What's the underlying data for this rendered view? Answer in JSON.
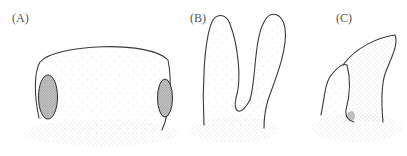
{
  "figure": {
    "panels": [
      {
        "id": "A",
        "label": "(A)"
      },
      {
        "id": "B",
        "label": "(B)"
      },
      {
        "id": "C",
        "label": "(C)"
      }
    ],
    "colors": {
      "outline": "#3a3a3a",
      "stipple": "#9a9a9a",
      "background": "#ffffff"
    }
  }
}
